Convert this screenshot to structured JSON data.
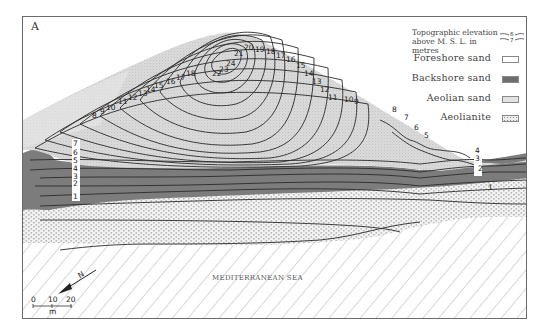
{
  "figure": {
    "panel_label": "A",
    "sea_label": "MEDITERRANEAN SEA"
  },
  "legend": {
    "topographic_label_line1": "Topographic elevation",
    "topographic_label_line2": "above M. S. L.  in metres",
    "topographic_symbol_upper": "6",
    "topographic_symbol_lower": "7",
    "items": [
      {
        "label": "Foreshore  sand",
        "swatch": "foreshore-sand",
        "color": "#ffffff"
      },
      {
        "label": "Backshore  sand",
        "swatch": "backshore-sand",
        "color": "#7a7a7a"
      },
      {
        "label": "Aeolian  sand",
        "swatch": "aeolian-sand",
        "color": "#e2e2e2"
      },
      {
        "label": "Aeolianite",
        "swatch": "aeolianite",
        "color": "#cfcfcf"
      }
    ]
  },
  "contours": {
    "dune_labels": [
      "24",
      "23",
      "22",
      "21",
      "20",
      "19",
      "18",
      "17",
      "16",
      "15",
      "14",
      "13",
      "12",
      "11",
      "10",
      "9",
      "8",
      "7",
      "6",
      "5"
    ],
    "west_labels": [
      "7",
      "6",
      "5",
      "4",
      "3",
      "2",
      "1"
    ],
    "east_labels": [
      "4",
      "3",
      "2",
      "1"
    ],
    "west_upper_labels": [
      "8",
      "9",
      "10",
      "11",
      "12",
      "13",
      "14",
      "15",
      "16",
      "17",
      "18"
    ]
  },
  "scale_bar": {
    "ticks": [
      "0",
      "10",
      "20"
    ],
    "unit": "m"
  },
  "north_arrow": {
    "label": "N"
  }
}
